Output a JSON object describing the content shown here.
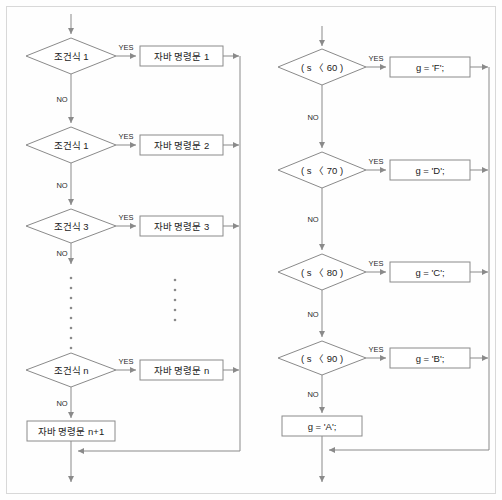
{
  "diagram": {
    "type": "flowchart",
    "edge_labels": {
      "yes": "YES",
      "no": "NO"
    },
    "colors": {
      "stroke": "#8a8a8a",
      "text": "#1c1c1c",
      "shape_fill": "#ffffff",
      "background": "#fefefe",
      "frame": "#d8d8d8"
    },
    "left_chart": {
      "name": "generic-if-else-if",
      "rows": [
        {
          "condition": "조건식 1",
          "action": "자바 명령문 1"
        },
        {
          "condition": "조건식 1",
          "action": "자바 명령문 2"
        },
        {
          "condition": "조건식 3",
          "action": "자바 명령문 3"
        },
        {
          "condition": "조건식 n",
          "action": "자바 명령문 n"
        }
      ],
      "final_action": "자바 명령문 n+1",
      "ellipsis_note": "vertical dotted continuation between row 3 and row n"
    },
    "right_chart": {
      "name": "grade-assignment-example",
      "rows": [
        {
          "condition": "( s 〈 60 )",
          "action": "g = 'F';"
        },
        {
          "condition": "( s 〈 70 )",
          "action": "g = 'D';"
        },
        {
          "condition": "( s 〈 80 )",
          "action": "g = 'C';"
        },
        {
          "condition": "( s 〈 90 )",
          "action": "g = 'B';"
        }
      ],
      "final_action": "g = 'A';"
    }
  }
}
